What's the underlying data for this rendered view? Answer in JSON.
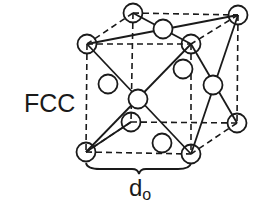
{
  "diagram": {
    "label": "FCC",
    "dimension_label": "d",
    "dimension_subscript": "o",
    "stroke_color": "#1a1a1a",
    "background": "#ffffff",
    "atom_radius": 9.5,
    "atoms": {
      "corners": [
        {
          "id": "top-back-left",
          "x": 133,
          "y": 13
        },
        {
          "id": "top-back-right",
          "x": 238,
          "y": 15
        },
        {
          "id": "top-front-left",
          "x": 87,
          "y": 44
        },
        {
          "id": "top-front-right",
          "x": 191,
          "y": 44
        },
        {
          "id": "bottom-back-left",
          "x": 131,
          "y": 122
        },
        {
          "id": "bottom-back-right",
          "x": 237,
          "y": 123
        },
        {
          "id": "bottom-front-left",
          "x": 86,
          "y": 152
        },
        {
          "id": "bottom-front-right",
          "x": 191,
          "y": 154
        }
      ],
      "face_centers": [
        {
          "id": "top-face",
          "x": 163,
          "y": 29
        },
        {
          "id": "front-face",
          "x": 138,
          "y": 99
        },
        {
          "id": "right-face",
          "x": 213,
          "y": 85
        },
        {
          "id": "left-face",
          "x": 108,
          "y": 84
        },
        {
          "id": "back-face",
          "x": 183,
          "y": 69
        },
        {
          "id": "bottom-face",
          "x": 162,
          "y": 143
        }
      ]
    }
  }
}
